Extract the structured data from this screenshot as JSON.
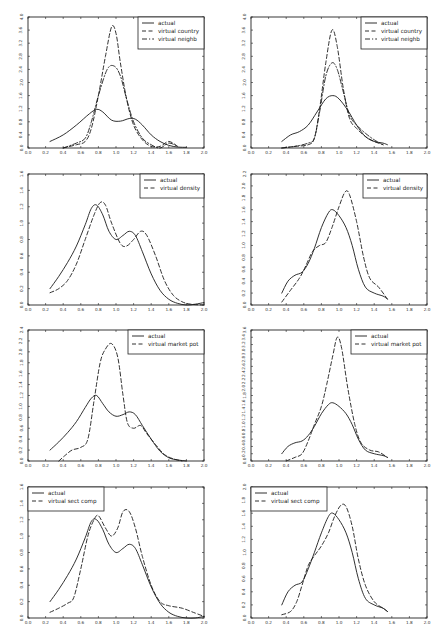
{
  "chart_data": [
    {
      "id": "r1c1",
      "type": "line",
      "xlim": [
        0.0,
        2.0
      ],
      "ylim": [
        0.0,
        4.0
      ],
      "xticks": [
        "0.0",
        "0.2",
        "0.4",
        "0.6",
        "0.8",
        "1.0",
        "1.2",
        "1.4",
        "1.6",
        "1.8",
        "2.0"
      ],
      "yticks": [
        "0.0",
        "0.4",
        "0.8",
        "1.2",
        "1.6",
        "2.0",
        "2.4",
        "2.8",
        "3.2",
        "3.6",
        "4.0"
      ],
      "legend_position": "upper right",
      "series": [
        {
          "name": "actual",
          "style": "solid",
          "x": [
            0.25,
            0.4,
            0.55,
            0.7,
            0.78,
            0.85,
            0.95,
            1.05,
            1.15,
            1.22,
            1.3,
            1.4,
            1.5,
            1.6,
            1.7,
            1.8
          ],
          "y": [
            0.2,
            0.4,
            0.7,
            1.05,
            1.18,
            1.1,
            0.85,
            0.82,
            0.9,
            0.88,
            0.7,
            0.4,
            0.2,
            0.08,
            0.03,
            0.02
          ]
        },
        {
          "name": "virtual country",
          "style": "dashed",
          "x": [
            0.4,
            0.55,
            0.65,
            0.72,
            0.8,
            0.88,
            0.95,
            1.0,
            1.05,
            1.12,
            1.2,
            1.3,
            1.4,
            1.5,
            1.6,
            1.7
          ],
          "y": [
            0.0,
            0.1,
            0.2,
            0.6,
            1.6,
            2.8,
            3.7,
            3.5,
            2.6,
            1.5,
            0.7,
            0.25,
            0.05,
            0.05,
            0.2,
            0.05
          ]
        },
        {
          "name": "virtual neighb",
          "style": "dashdot",
          "x": [
            0.4,
            0.55,
            0.65,
            0.72,
            0.8,
            0.9,
            0.98,
            1.05,
            1.12,
            1.2,
            1.3,
            1.4,
            1.5,
            1.6,
            1.7
          ],
          "y": [
            0.0,
            0.15,
            0.3,
            0.8,
            1.6,
            2.4,
            2.5,
            2.2,
            1.5,
            0.8,
            0.3,
            0.1,
            0.0,
            0.15,
            0.05
          ]
        }
      ]
    },
    {
      "id": "r1c2",
      "type": "line",
      "xlim": [
        0.0,
        2.0
      ],
      "ylim": [
        0.0,
        4.0
      ],
      "xticks": [
        "0.0",
        "0.2",
        "0.4",
        "0.6",
        "0.8",
        "1.0",
        "1.2",
        "1.4",
        "1.6",
        "1.8",
        "2.0"
      ],
      "yticks": [
        "0.0",
        "0.4",
        "0.8",
        "1.2",
        "1.6",
        "2.0",
        "2.4",
        "2.8",
        "3.2",
        "3.6",
        "4.0"
      ],
      "legend_position": "upper right",
      "series": [
        {
          "name": "actual",
          "style": "solid",
          "x": [
            0.35,
            0.45,
            0.55,
            0.65,
            0.75,
            0.85,
            0.93,
            1.0,
            1.1,
            1.2,
            1.3,
            1.4,
            1.5,
            1.55
          ],
          "y": [
            0.2,
            0.4,
            0.5,
            0.7,
            1.1,
            1.5,
            1.6,
            1.5,
            1.15,
            0.7,
            0.35,
            0.2,
            0.15,
            0.1
          ]
        },
        {
          "name": "virtual country",
          "style": "dashed",
          "x": [
            0.35,
            0.5,
            0.65,
            0.72,
            0.78,
            0.85,
            0.92,
            0.98,
            1.05,
            1.12,
            1.2,
            1.3,
            1.4,
            1.5
          ],
          "y": [
            0.0,
            0.05,
            0.1,
            0.3,
            1.2,
            2.6,
            3.6,
            3.1,
            1.8,
            0.9,
            0.6,
            0.35,
            0.2,
            0.1
          ]
        },
        {
          "name": "virtual neighb",
          "style": "dashdot",
          "x": [
            0.35,
            0.5,
            0.65,
            0.72,
            0.78,
            0.85,
            0.92,
            0.98,
            1.05,
            1.12,
            1.2,
            1.3,
            1.4,
            1.5
          ],
          "y": [
            0.0,
            0.05,
            0.15,
            0.3,
            1.1,
            2.2,
            2.6,
            2.4,
            1.7,
            1.0,
            0.7,
            0.45,
            0.25,
            0.1
          ]
        }
      ]
    },
    {
      "id": "r2c1",
      "type": "line",
      "xlim": [
        0.0,
        2.0
      ],
      "ylim": [
        0.0,
        1.6
      ],
      "xticks": [
        "0.0",
        "0.2",
        "0.4",
        "0.6",
        "0.8",
        "1.0",
        "1.2",
        "1.4",
        "1.6",
        "1.8",
        "2.0"
      ],
      "yticks": [
        "0.0",
        "0.2",
        "0.4",
        "0.6",
        "0.8",
        "1.0",
        "1.2",
        "1.4",
        "1.6"
      ],
      "legend_position": "upper right",
      "series": [
        {
          "name": "actual",
          "style": "solid",
          "x": [
            0.25,
            0.35,
            0.45,
            0.55,
            0.65,
            0.72,
            0.78,
            0.85,
            0.92,
            1.0,
            1.08,
            1.15,
            1.22,
            1.3,
            1.4,
            1.5,
            1.6,
            1.7,
            1.8,
            1.9,
            2.0
          ],
          "y": [
            0.2,
            0.35,
            0.52,
            0.72,
            0.98,
            1.18,
            1.22,
            1.1,
            0.9,
            0.8,
            0.85,
            0.9,
            0.85,
            0.65,
            0.38,
            0.18,
            0.07,
            0.02,
            0.0,
            0.01,
            0.03
          ]
        },
        {
          "name": "virtual density",
          "style": "dashed",
          "x": [
            0.25,
            0.35,
            0.45,
            0.55,
            0.65,
            0.75,
            0.82,
            0.88,
            0.95,
            1.05,
            1.12,
            1.2,
            1.28,
            1.35,
            1.45,
            1.55,
            1.65,
            1.75,
            1.85,
            2.0
          ],
          "y": [
            0.15,
            0.2,
            0.3,
            0.5,
            0.8,
            1.1,
            1.25,
            1.22,
            1.0,
            0.75,
            0.72,
            0.8,
            0.9,
            0.85,
            0.6,
            0.3,
            0.12,
            0.04,
            0.01,
            0.0
          ]
        }
      ]
    },
    {
      "id": "r2c2",
      "type": "line",
      "xlim": [
        0.0,
        2.0
      ],
      "ylim": [
        0.0,
        2.2
      ],
      "xticks": [
        "0.0",
        "0.2",
        "0.4",
        "0.6",
        "0.8",
        "1.0",
        "1.2",
        "1.4",
        "1.6",
        "1.8",
        "2.0"
      ],
      "yticks": [
        "0.0",
        "0.2",
        "0.4",
        "0.6",
        "0.8",
        "1.0",
        "1.2",
        "1.4",
        "1.6",
        "1.8",
        "2.0",
        "2.2"
      ],
      "legend_position": "upper right",
      "series": [
        {
          "name": "actual",
          "style": "solid",
          "x": [
            0.35,
            0.42,
            0.5,
            0.58,
            0.65,
            0.72,
            0.8,
            0.88,
            0.93,
            1.0,
            1.08,
            1.15,
            1.22,
            1.3,
            1.4,
            1.5,
            1.55
          ],
          "y": [
            0.2,
            0.4,
            0.5,
            0.55,
            0.7,
            0.95,
            1.3,
            1.55,
            1.6,
            1.5,
            1.3,
            1.0,
            0.6,
            0.3,
            0.2,
            0.15,
            0.1
          ]
        },
        {
          "name": "virtual density",
          "style": "dashed",
          "x": [
            0.35,
            0.45,
            0.55,
            0.62,
            0.7,
            0.78,
            0.85,
            0.92,
            1.0,
            1.07,
            1.12,
            1.2,
            1.28,
            1.35,
            1.45,
            1.55
          ],
          "y": [
            0.05,
            0.25,
            0.45,
            0.65,
            0.9,
            1.0,
            1.05,
            1.3,
            1.65,
            1.9,
            1.85,
            1.4,
            0.8,
            0.45,
            0.3,
            0.1
          ]
        }
      ]
    },
    {
      "id": "r3c1",
      "type": "line",
      "xlim": [
        0.0,
        2.0
      ],
      "ylim": [
        0.0,
        2.4
      ],
      "xticks": [
        "0.0",
        "0.2",
        "0.4",
        "0.6",
        "0.8",
        "1.0",
        "1.2",
        "1.4",
        "1.6",
        "1.8",
        "2.0"
      ],
      "yticks": [
        "0.0",
        "0.2",
        "0.4",
        "0.6",
        "0.8",
        "1.0",
        "1.2",
        "1.4",
        "1.6",
        "1.8",
        "2.0",
        "2.2",
        "2.4"
      ],
      "legend_position": "upper right",
      "series": [
        {
          "name": "actual",
          "style": "solid",
          "x": [
            0.25,
            0.35,
            0.45,
            0.55,
            0.65,
            0.72,
            0.78,
            0.85,
            0.92,
            1.0,
            1.08,
            1.15,
            1.22,
            1.3,
            1.4,
            1.5,
            1.6,
            1.7,
            1.8
          ],
          "y": [
            0.2,
            0.35,
            0.52,
            0.72,
            0.98,
            1.15,
            1.2,
            1.05,
            0.9,
            0.82,
            0.85,
            0.9,
            0.85,
            0.65,
            0.4,
            0.18,
            0.06,
            0.02,
            0.0
          ]
        },
        {
          "name": "virtual market pot",
          "style": "dashed",
          "x": [
            0.35,
            0.42,
            0.5,
            0.6,
            0.68,
            0.75,
            0.82,
            0.88,
            0.95,
            1.02,
            1.08,
            1.13,
            1.2,
            1.28,
            1.35,
            1.45,
            1.55,
            1.65,
            1.75
          ],
          "y": [
            0.0,
            0.1,
            0.2,
            0.25,
            0.4,
            1.1,
            1.8,
            2.05,
            2.15,
            1.9,
            1.2,
            0.7,
            0.6,
            0.65,
            0.5,
            0.3,
            0.12,
            0.04,
            0.0
          ]
        }
      ]
    },
    {
      "id": "r3c2",
      "type": "line",
      "xlim": [
        0.0,
        2.0
      ],
      "ylim": [
        0.0,
        3.6
      ],
      "xticks": [
        "0.0",
        "0.2",
        "0.4",
        "0.6",
        "0.8",
        "1.0",
        "1.2",
        "1.4",
        "1.6",
        "1.8",
        "2.0"
      ],
      "yticks": [
        "0.0",
        "0.2",
        "0.4",
        "0.6",
        "0.8",
        "1.0",
        "1.2",
        "1.4",
        "1.6",
        "1.8",
        "2.0",
        "2.2",
        "2.4",
        "2.6",
        "2.8",
        "3.0",
        "3.2",
        "3.4",
        "3.6"
      ],
      "legend_position": "upper right",
      "series": [
        {
          "name": "actual",
          "style": "solid",
          "x": [
            0.35,
            0.42,
            0.5,
            0.58,
            0.65,
            0.72,
            0.8,
            0.88,
            0.93,
            1.0,
            1.08,
            1.15,
            1.22,
            1.3,
            1.4,
            1.5,
            1.55
          ],
          "y": [
            0.2,
            0.4,
            0.5,
            0.55,
            0.7,
            0.95,
            1.3,
            1.55,
            1.6,
            1.5,
            1.3,
            1.0,
            0.6,
            0.3,
            0.2,
            0.15,
            0.1
          ]
        },
        {
          "name": "virtual market pot",
          "style": "dashed",
          "x": [
            0.4,
            0.5,
            0.58,
            0.65,
            0.72,
            0.8,
            0.86,
            0.93,
            0.98,
            1.03,
            1.1,
            1.18,
            1.25,
            1.35,
            1.45,
            1.55
          ],
          "y": [
            0.0,
            0.1,
            0.2,
            0.55,
            1.0,
            1.5,
            2.1,
            2.9,
            3.4,
            3.1,
            2.0,
            1.0,
            0.5,
            0.3,
            0.25,
            0.1
          ]
        }
      ]
    },
    {
      "id": "r4c1",
      "type": "line",
      "xlim": [
        0.0,
        2.0
      ],
      "ylim": [
        0.0,
        1.6
      ],
      "xticks": [
        "0.0",
        "0.2",
        "0.4",
        "0.6",
        "0.8",
        "1.0",
        "1.2",
        "1.4",
        "1.6",
        "1.8",
        "2.0"
      ],
      "yticks": [
        "0.0",
        "0.2",
        "0.4",
        "0.6",
        "0.8",
        "1.0",
        "1.2",
        "1.4",
        "1.6"
      ],
      "legend_position": "upper left",
      "series": [
        {
          "name": "actual",
          "style": "solid",
          "x": [
            0.25,
            0.35,
            0.45,
            0.55,
            0.65,
            0.72,
            0.78,
            0.85,
            0.92,
            1.0,
            1.08,
            1.15,
            1.22,
            1.3,
            1.4,
            1.5,
            1.6,
            1.7,
            1.8,
            1.9,
            2.0
          ],
          "y": [
            0.2,
            0.35,
            0.52,
            0.72,
            0.98,
            1.18,
            1.2,
            1.08,
            0.9,
            0.8,
            0.85,
            0.9,
            0.85,
            0.65,
            0.38,
            0.18,
            0.07,
            0.02,
            0.0,
            0.0,
            0.02
          ]
        },
        {
          "name": "virtual sect comp",
          "style": "dashed",
          "x": [
            0.25,
            0.35,
            0.45,
            0.52,
            0.6,
            0.68,
            0.75,
            0.8,
            0.88,
            0.95,
            1.02,
            1.08,
            1.15,
            1.22,
            1.3,
            1.4,
            1.5,
            1.6,
            1.75,
            1.9,
            2.0
          ],
          "y": [
            0.07,
            0.12,
            0.18,
            0.25,
            0.6,
            1.0,
            1.2,
            1.25,
            1.1,
            1.0,
            1.1,
            1.3,
            1.3,
            1.1,
            0.75,
            0.4,
            0.2,
            0.15,
            0.12,
            0.06,
            0.02
          ]
        }
      ]
    },
    {
      "id": "r4c2",
      "type": "line",
      "xlim": [
        0.0,
        2.0
      ],
      "ylim": [
        0.0,
        2.0
      ],
      "xticks": [
        "0.0",
        "0.2",
        "0.4",
        "0.6",
        "0.8",
        "1.0",
        "1.2",
        "1.4",
        "1.6",
        "1.8",
        "2.0"
      ],
      "yticks": [
        "0.0",
        "0.2",
        "0.4",
        "0.6",
        "0.8",
        "1.0",
        "1.2",
        "1.4",
        "1.6",
        "1.8",
        "2.0"
      ],
      "legend_position": "upper left",
      "series": [
        {
          "name": "actual",
          "style": "solid",
          "x": [
            0.35,
            0.42,
            0.5,
            0.58,
            0.65,
            0.72,
            0.8,
            0.88,
            0.93,
            1.0,
            1.08,
            1.15,
            1.22,
            1.3,
            1.4,
            1.5,
            1.55
          ],
          "y": [
            0.2,
            0.4,
            0.5,
            0.55,
            0.75,
            1.0,
            1.3,
            1.55,
            1.6,
            1.5,
            1.3,
            1.0,
            0.6,
            0.3,
            0.2,
            0.15,
            0.1
          ]
        },
        {
          "name": "virtual sect comp",
          "style": "dashed",
          "x": [
            0.35,
            0.45,
            0.52,
            0.58,
            0.65,
            0.72,
            0.8,
            0.88,
            0.95,
            1.02,
            1.08,
            1.15,
            1.22,
            1.3,
            1.4,
            1.5,
            1.55
          ],
          "y": [
            0.05,
            0.1,
            0.25,
            0.5,
            0.8,
            0.95,
            1.1,
            1.3,
            1.55,
            1.72,
            1.7,
            1.4,
            0.9,
            0.5,
            0.25,
            0.15,
            0.1
          ]
        }
      ]
    }
  ]
}
